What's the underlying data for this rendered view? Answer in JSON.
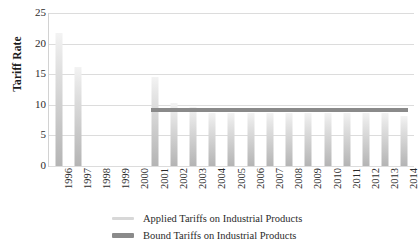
{
  "chart_data": {
    "type": "bar",
    "title": "",
    "xlabel": "",
    "ylabel": "Tariff Rate",
    "ylim": [
      0,
      25
    ],
    "yticks": [
      0,
      5,
      10,
      15,
      20,
      25
    ],
    "grid": true,
    "legend_position": "bottom",
    "categories": [
      "1996",
      "1997",
      "1998",
      "1999",
      "2000",
      "2001",
      "2002",
      "2003",
      "2004",
      "2005",
      "2006",
      "2007",
      "2008",
      "2009",
      "2010",
      "2011",
      "2012",
      "2013",
      "2014"
    ],
    "series": [
      {
        "name": "Applied Tariffs on Industrial Products",
        "render": "bar",
        "color": "#cfcfcf",
        "values": [
          21.8,
          16.2,
          null,
          null,
          null,
          14.5,
          10.3,
          9.7,
          8.6,
          8.6,
          8.6,
          8.6,
          8.6,
          8.6,
          8.6,
          8.6,
          8.6,
          8.6,
          8.2
        ]
      },
      {
        "name": "Bound Tariffs on Industrial Products",
        "render": "line",
        "color": "#8a8a8a",
        "values": [
          null,
          null,
          null,
          null,
          null,
          9.2,
          9.2,
          9.2,
          9.2,
          9.2,
          9.2,
          9.2,
          9.2,
          9.2,
          9.2,
          9.2,
          9.2,
          9.2,
          9.2
        ]
      }
    ]
  },
  "axis": {
    "y_title": "Tariff Rate",
    "y_ticks": [
      "0",
      "5",
      "10",
      "15",
      "20",
      "25"
    ],
    "x_ticks": [
      "1996",
      "1997",
      "1998",
      "1999",
      "2000",
      "2001",
      "2002",
      "2003",
      "2004",
      "2005",
      "2006",
      "2007",
      "2008",
      "2009",
      "2010",
      "2011",
      "2012",
      "2013",
      "2014"
    ]
  },
  "legend": {
    "items": [
      {
        "label": "Applied Tariffs on Industrial Products",
        "swatch": "light-gray-line"
      },
      {
        "label": "Bound Tariffs on Industrial Products",
        "swatch": "dark-gray-line"
      }
    ]
  },
  "colors": {
    "bar_light": "#e6e6e6",
    "bar_dark": "#b4b4b4",
    "bound_line": "#8a8a8a",
    "gridline": "#dcdcdc",
    "text": "#2b2b2b"
  }
}
